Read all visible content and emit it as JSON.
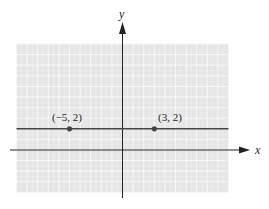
{
  "chart_data": {
    "type": "line",
    "title": "",
    "xlabel": "x",
    "ylabel": "y",
    "xlim": [
      -10,
      10
    ],
    "ylim": [
      -4,
      10
    ],
    "grid": true,
    "series": [
      {
        "name": "horizontal line y = 2",
        "x": [
          -10,
          10
        ],
        "y": [
          2,
          2
        ]
      }
    ],
    "points": [
      {
        "x": -5,
        "y": 2,
        "label": "(−5, 2)"
      },
      {
        "x": 3,
        "y": 2,
        "label": "(3, 2)"
      }
    ],
    "colors": {
      "grid_background": "#e6e6e6",
      "grid_lines": "#f7f7f7",
      "axes": "#222222",
      "line": "#444444",
      "points": "#444444"
    }
  },
  "labels": {
    "x_axis": "x",
    "y_axis": "y",
    "point_a": "(−5, 2)",
    "point_b": "(3, 2)"
  }
}
